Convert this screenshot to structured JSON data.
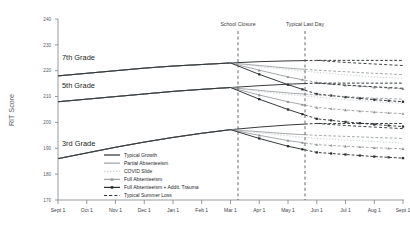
{
  "chart_data": {
    "type": "line",
    "title": "",
    "xlabel": "",
    "ylabel": "RIT Score",
    "ylim": [
      170,
      240
    ],
    "yticks": [
      170,
      180,
      190,
      200,
      210,
      220,
      230,
      240
    ],
    "x": [
      "Sept 1",
      "Oct 1",
      "Nov 1",
      "Dec 1",
      "Jan 1",
      "Feb 1",
      "Mar 1",
      "Apr 1",
      "May 1",
      "Jun 1",
      "Jul 1",
      "Aug 1",
      "Sept 1"
    ],
    "xticklabels": [
      "Sept 1",
      "Oct 1",
      "Nov 1",
      "Dec 1",
      "Jan 1",
      "Feb 1",
      "Mar 1",
      "Apr 1",
      "May 1",
      "Jun 1",
      "Jul 1",
      "Aug 1",
      "Sept 1"
    ],
    "grid": false,
    "legend_position": "inside-center-lower",
    "annotations": [
      {
        "label": "School Closure",
        "x": "Mar 15",
        "type": "vertical-dashed-line"
      },
      {
        "label": "Typical Last Day",
        "x": "May 20",
        "type": "vertical-dashed-line"
      }
    ],
    "group_labels": [
      "7th Grade",
      "5th Grade",
      "3rd Grade"
    ],
    "series": [
      {
        "name": "Typical Growth",
        "group": "7th Grade",
        "style": "solid-dark",
        "values": [
          218.0,
          219.0,
          220.0,
          221.0,
          221.8,
          222.4,
          223.0,
          223.5,
          223.8,
          224.0,
          224.0,
          224.0,
          224.0
        ]
      },
      {
        "name": "Partial Absenteeism",
        "group": "7th Grade",
        "style": "solid-gray",
        "values": [
          218.0,
          219.0,
          220.0,
          221.0,
          221.8,
          222.4,
          223.0,
          222.0,
          221.0,
          220.2,
          219.6,
          219.0,
          218.5
        ]
      },
      {
        "name": "COVID Slide",
        "group": "7th Grade",
        "style": "dotted-gray",
        "values": [
          218.0,
          219.0,
          220.0,
          221.0,
          221.8,
          222.4,
          223.0,
          221.6,
          220.4,
          219.4,
          218.4,
          217.6,
          217.0
        ]
      },
      {
        "name": "Full Absenteeism",
        "group": "7th Grade",
        "style": "triangle-gray",
        "values": [
          218.0,
          219.0,
          220.0,
          221.0,
          221.8,
          222.4,
          223.0,
          220.2,
          217.6,
          215.4,
          214.4,
          213.6,
          213.0
        ]
      },
      {
        "name": "Full Absenteeism + Addit. Trauma",
        "group": "7th Grade",
        "style": "square-dark",
        "values": [
          218.0,
          219.0,
          220.0,
          221.0,
          221.8,
          222.4,
          223.0,
          218.6,
          214.6,
          211.0,
          209.8,
          208.8,
          208.0
        ]
      },
      {
        "name": "Typical Summer Loss",
        "group": "7th Grade",
        "style": "dashed-dark",
        "values": [
          null,
          null,
          null,
          null,
          null,
          null,
          null,
          null,
          null,
          224.0,
          223.2,
          222.6,
          222.0
        ]
      },
      {
        "name": "Typical Growth",
        "group": "5th Grade",
        "style": "solid-dark",
        "values": [
          208.0,
          209.0,
          210.0,
          211.0,
          212.0,
          212.8,
          213.5,
          214.2,
          214.8,
          215.2,
          215.2,
          215.2,
          215.2
        ]
      },
      {
        "name": "Partial Absenteeism",
        "group": "5th Grade",
        "style": "solid-gray",
        "values": [
          208.0,
          209.0,
          210.0,
          211.0,
          212.0,
          212.8,
          213.5,
          212.4,
          211.4,
          210.6,
          210.0,
          209.4,
          209.0
        ]
      },
      {
        "name": "COVID Slide",
        "group": "5th Grade",
        "style": "dotted-gray",
        "values": [
          208.0,
          209.0,
          210.0,
          211.0,
          212.0,
          212.8,
          213.5,
          212.0,
          210.8,
          209.8,
          208.8,
          208.0,
          207.4
        ]
      },
      {
        "name": "Full Absenteeism",
        "group": "5th Grade",
        "style": "triangle-gray",
        "values": [
          208.0,
          209.0,
          210.0,
          211.0,
          212.0,
          212.8,
          213.5,
          210.6,
          208.0,
          205.8,
          204.8,
          204.0,
          203.4
        ]
      },
      {
        "name": "Full Absenteeism + Addit. Trauma",
        "group": "5th Grade",
        "style": "square-dark",
        "values": [
          208.0,
          209.0,
          210.0,
          211.0,
          212.0,
          212.8,
          213.5,
          209.0,
          205.0,
          201.4,
          200.2,
          199.2,
          198.4
        ]
      },
      {
        "name": "Typical Summer Loss",
        "group": "5th Grade",
        "style": "dashed-dark",
        "values": [
          null,
          null,
          null,
          null,
          null,
          null,
          null,
          null,
          null,
          215.2,
          214.4,
          213.8,
          213.2
        ]
      },
      {
        "name": "Typical Growth",
        "group": "3rd Grade",
        "style": "solid-dark",
        "values": [
          186.0,
          188.2,
          190.4,
          192.4,
          194.2,
          195.8,
          197.2,
          198.2,
          199.0,
          199.6,
          199.6,
          199.6,
          199.6
        ]
      },
      {
        "name": "Partial Absenteeism",
        "group": "3rd Grade",
        "style": "solid-gray",
        "values": [
          186.0,
          188.2,
          190.4,
          192.4,
          194.2,
          195.8,
          197.2,
          196.4,
          195.6,
          195.0,
          194.6,
          194.2,
          193.8
        ]
      },
      {
        "name": "COVID Slide",
        "group": "3rd Grade",
        "style": "dotted-gray",
        "values": [
          186.0,
          188.2,
          190.4,
          192.4,
          194.2,
          195.8,
          197.2,
          196.0,
          194.8,
          193.8,
          193.2,
          192.6,
          192.0
        ]
      },
      {
        "name": "Full Absenteeism",
        "group": "3rd Grade",
        "style": "triangle-gray",
        "values": [
          186.0,
          188.2,
          190.4,
          192.4,
          194.2,
          195.8,
          197.2,
          195.0,
          193.0,
          191.4,
          190.8,
          190.2,
          189.8
        ]
      },
      {
        "name": "Full Absenteeism + Addit. Trauma",
        "group": "3rd Grade",
        "style": "square-dark",
        "values": [
          186.0,
          188.2,
          190.4,
          192.4,
          194.2,
          195.8,
          197.2,
          193.8,
          190.8,
          188.4,
          187.6,
          186.8,
          186.2
        ]
      },
      {
        "name": "Typical Summer Loss",
        "group": "3rd Grade",
        "style": "dashed-dark",
        "values": [
          null,
          null,
          null,
          null,
          null,
          null,
          null,
          null,
          null,
          199.6,
          198.8,
          198.2,
          197.6
        ]
      }
    ]
  },
  "legend": {
    "items": [
      {
        "label": "Typical Growth",
        "marker": "solid-dark-line"
      },
      {
        "label": "Partial Absenteeism",
        "marker": "solid-gray-line"
      },
      {
        "label": "COVID Slide",
        "marker": "dotted-gray-line"
      },
      {
        "label": "Full Absenteeism",
        "marker": "triangle-marker-line"
      },
      {
        "label": "Full Absenteeism + Addit. Trauma",
        "marker": "square-marker-line"
      },
      {
        "label": "Typical Summer Loss",
        "marker": "dashed-dark-line"
      }
    ]
  },
  "colors": {
    "dark": "#2b2f31",
    "gray": "#8e9396",
    "light_gray": "#c2c6c9",
    "axis": "#8b9094",
    "text": "#2b2f31"
  }
}
